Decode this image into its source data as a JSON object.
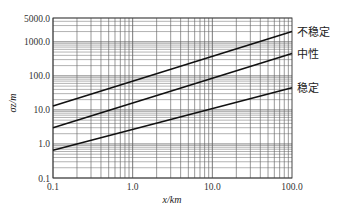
{
  "chart_data": {
    "type": "line",
    "title": "",
    "xlabel": "x/km",
    "ylabel": "σz/m",
    "xscale": "log",
    "yscale": "log",
    "xlim": [
      0.1,
      100.0
    ],
    "ylim": [
      0.1,
      5000.0
    ],
    "grid": true,
    "x_tick_labels": [
      "0.1",
      "1.0",
      "10.0",
      "100.0"
    ],
    "x_ticks": [
      0.1,
      1.0,
      10.0,
      100.0
    ],
    "y_tick_labels": [
      "0.1",
      "1.0",
      "10.0",
      "100.0",
      "1000.0",
      "5000.0"
    ],
    "y_ticks": [
      0.1,
      1.0,
      10.0,
      100.0,
      1000.0,
      5000.0
    ],
    "legend_position": "right-inline",
    "series": [
      {
        "name": "不稳定",
        "x": [
          0.1,
          100.0
        ],
        "values": [
          13,
          2000
        ]
      },
      {
        "name": "中性",
        "x": [
          0.1,
          100.0
        ],
        "values": [
          3,
          450
        ]
      },
      {
        "name": "稳定",
        "x": [
          0.1,
          100.0
        ],
        "values": [
          0.65,
          45
        ]
      }
    ]
  }
}
